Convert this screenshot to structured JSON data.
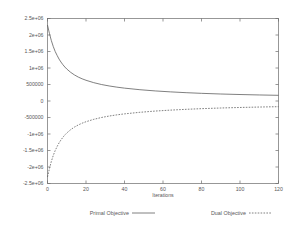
{
  "chart_data": {
    "type": "line",
    "title": "",
    "xlabel": "Iterations",
    "ylabel": "",
    "xlim": [
      0,
      120
    ],
    "ylim": [
      -2500000,
      2500000
    ],
    "grid": false,
    "legend_position": "below",
    "xticks": [
      "0",
      "20",
      "40",
      "60",
      "80",
      "100",
      "120"
    ],
    "xtick_values": [
      0,
      20,
      40,
      60,
      80,
      100,
      120
    ],
    "yticks": [
      "-2.5e+06",
      "-2e+06",
      "-1.5e+06",
      "-1e+06",
      "-500000",
      "0",
      "500000",
      "1e+06",
      "1.5e+06",
      "2e+06",
      "2.5e+06"
    ],
    "ytick_values": [
      -2500000,
      -2000000,
      -1500000,
      -1000000,
      -500000,
      0,
      500000,
      1000000,
      1500000,
      2000000,
      2500000
    ],
    "x": [
      0,
      1,
      2,
      3,
      4,
      5,
      6,
      7,
      8,
      9,
      10,
      12,
      14,
      16,
      18,
      20,
      24,
      28,
      32,
      36,
      40,
      48,
      56,
      64,
      72,
      80,
      90,
      100,
      110,
      120
    ],
    "series": [
      {
        "name": "Primal Objective",
        "style": "solid",
        "values": [
          2300000,
          2050000,
          1830000,
          1650000,
          1500000,
          1380000,
          1270000,
          1180000,
          1100000,
          1030000,
          970000,
          870000,
          790000,
          725000,
          672000,
          628000,
          556000,
          500000,
          456000,
          420000,
          390000,
          342000,
          305000,
          276000,
          252000,
          232000,
          212000,
          196000,
          183000,
          172000
        ]
      },
      {
        "name": "Dual Objective",
        "style": "dashed",
        "values": [
          -2300000,
          -2050000,
          -1830000,
          -1650000,
          -1500000,
          -1380000,
          -1270000,
          -1180000,
          -1100000,
          -1030000,
          -970000,
          -870000,
          -790000,
          -725000,
          -672000,
          -628000,
          -556000,
          -500000,
          -456000,
          -420000,
          -390000,
          -342000,
          -305000,
          -276000,
          -252000,
          -232000,
          -212000,
          -196000,
          -183000,
          -172000
        ]
      }
    ],
    "legend": [
      {
        "label": "Primal Objective",
        "style": "solid"
      },
      {
        "label": "Dual Objective",
        "style": "dashed"
      }
    ],
    "colors": {
      "line": "#555555",
      "axis": "#6b6b6b",
      "text": "#585858",
      "background": "#ffffff"
    }
  }
}
